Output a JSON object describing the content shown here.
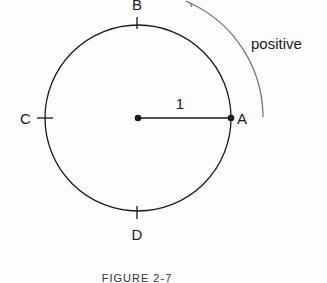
{
  "diagram": {
    "points": {
      "A": "A",
      "B": "B",
      "C": "C",
      "D": "D"
    },
    "radius_label": "1",
    "direction_label": "positive",
    "caption": "FIGURE  2-7"
  },
  "colors": {
    "stroke": "#1a1a1a",
    "arc": "#777777",
    "background": "#fdfdfd"
  }
}
